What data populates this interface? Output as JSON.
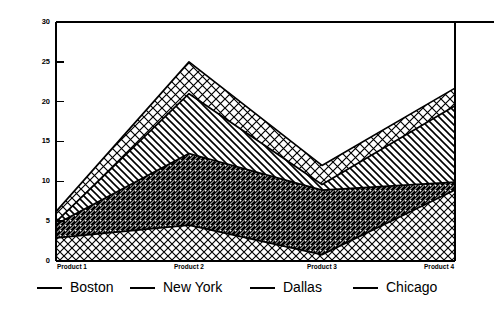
{
  "chart_data": {
    "type": "area",
    "stacked": true,
    "title": "",
    "subtitle": "",
    "xlabel": "",
    "ylabel": "",
    "categories": [
      "Product 1",
      "Product 2",
      "Product 3",
      "Product 4"
    ],
    "series": [
      {
        "name": "Boston",
        "values": [
          2.9,
          4.5,
          0.8,
          8.9
        ],
        "pattern": "cross-hatch-diamond"
      },
      {
        "name": "New York",
        "values": [
          1.7,
          9.0,
          8.1,
          1.0
        ],
        "pattern": "diagonal-hatch-left"
      },
      {
        "name": "Dallas",
        "values": [
          0.3,
          7.5,
          0.7,
          9.6
        ],
        "pattern": "diagonal-hatch-right"
      },
      {
        "name": "Chicago",
        "values": [
          1.3,
          4.0,
          2.4,
          2.2
        ],
        "pattern": "grid-check"
      }
    ],
    "cumulative_tops": [
      [
        2.9,
        4.5,
        0.8,
        8.9
      ],
      [
        4.6,
        13.5,
        8.9,
        9.9
      ],
      [
        4.9,
        21.0,
        9.6,
        19.5
      ],
      [
        6.2,
        25.0,
        12.0,
        21.7
      ]
    ],
    "ylim": [
      0,
      30
    ],
    "yticks": [
      0,
      5,
      10,
      15,
      20,
      25,
      30
    ],
    "ytick_labels": [
      "0",
      "5",
      "10",
      "15",
      "20",
      "25",
      "30"
    ],
    "xlim": [
      0,
      3
    ],
    "grid": false,
    "legend_position": "bottom",
    "colors": {
      "line": "#000000",
      "background": "#ffffff",
      "axis": "#000000"
    }
  },
  "legend": {
    "entries": [
      {
        "label": "Boston"
      },
      {
        "label": "New York"
      },
      {
        "label": "Dallas"
      },
      {
        "label": "Chicago"
      }
    ]
  }
}
